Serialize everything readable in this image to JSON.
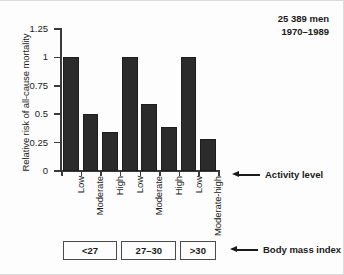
{
  "chart_data": {
    "type": "bar",
    "title": "",
    "xlabel": "Activity level",
    "ylabel": "Relative risk of all-cause mortality",
    "ylim": [
      0,
      1.25
    ],
    "yticks": [
      "0",
      "0.25",
      "0.5",
      "0.75",
      "1",
      "1.25"
    ],
    "ytick_values": [
      0,
      0.25,
      0.5,
      0.75,
      1,
      1.25
    ],
    "grid": false,
    "legend": "none",
    "categories": [
      "Low",
      "Moderate",
      "High",
      "Low",
      "Moderate",
      "High",
      "Low",
      "Moderate-high"
    ],
    "values": [
      1.0,
      0.5,
      0.34,
      1.0,
      0.59,
      0.39,
      1.0,
      0.28
    ],
    "bar_color": "#2b2b2b",
    "groups": [
      {
        "label": "<27",
        "span": 3
      },
      {
        "label": "27-30",
        "span": 3
      },
      {
        "label": ">30",
        "span": 2
      }
    ],
    "group_axis_label": "Body mass index",
    "annotations": [
      "25 389 men",
      "1970-1989"
    ]
  },
  "axis": {
    "ylabel": "Relative risk of all-cause mortality"
  },
  "note": {
    "line1": "25 389 men",
    "line2": "1970–1989"
  },
  "callouts": {
    "activity": "Activity level",
    "bmi": "Body mass index"
  },
  "bmi": {
    "groups": [
      "<27",
      "27–30",
      ">30"
    ]
  }
}
